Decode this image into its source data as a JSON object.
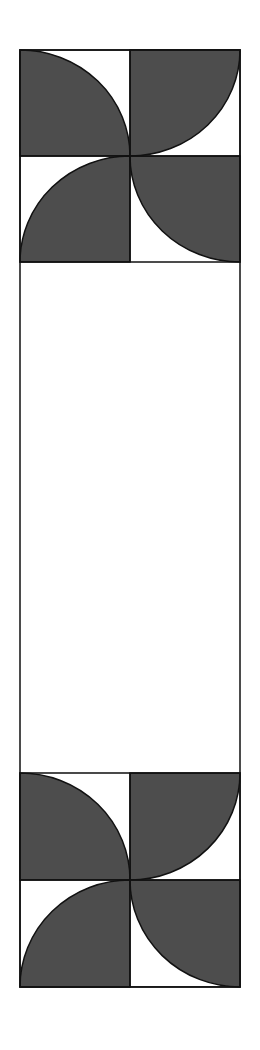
{
  "diagram": {
    "colors": {
      "fill": "#4d4d4d",
      "stroke": "#111111",
      "background": "#ffffff"
    },
    "outer_rect": {
      "x": 20,
      "y": 50,
      "width": 220,
      "height": 937
    },
    "blocks": [
      {
        "name": "top-pinwheel",
        "x": 20,
        "y": 50,
        "width": 220,
        "height": 212
      },
      {
        "name": "bottom-pinwheel",
        "x": 20,
        "y": 773,
        "width": 220,
        "height": 214
      }
    ]
  }
}
